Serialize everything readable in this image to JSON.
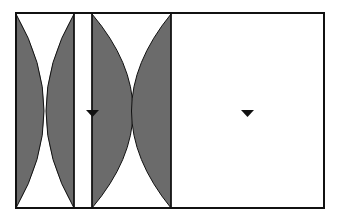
{
  "diagram": {
    "title": "",
    "colors": {
      "fill": "#6b6b6b",
      "stroke": "#111111",
      "background": "#ffffff"
    },
    "markers": [
      {
        "name": "water-level-marker-left",
        "symbol": "inverted-triangle"
      },
      {
        "name": "water-level-marker-right",
        "symbol": "inverted-triangle"
      }
    ]
  }
}
